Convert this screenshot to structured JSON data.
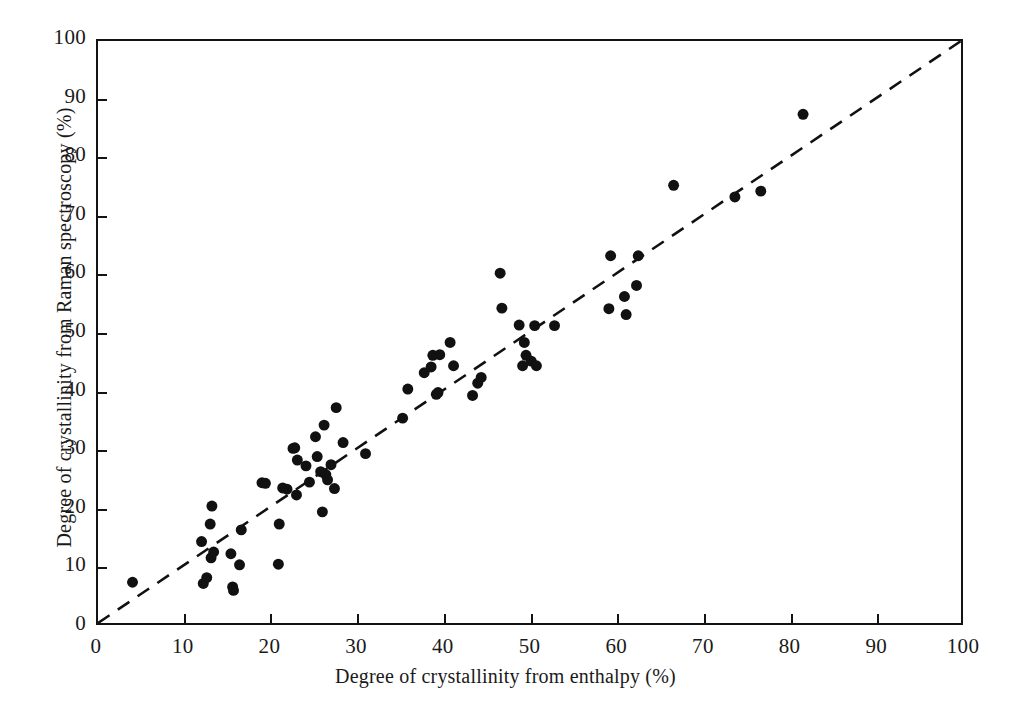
{
  "chart_data": {
    "type": "scatter",
    "title": "",
    "xlabel": "Degree of crystallinity from enthalpy (%)",
    "ylabel": "Degree of crystallinity from Raman spectroscopy (%)",
    "xlim": [
      0,
      100
    ],
    "ylim": [
      0,
      100
    ],
    "grid": false,
    "legend": null,
    "xticks": [
      0,
      10,
      20,
      30,
      40,
      50,
      60,
      70,
      80,
      90,
      100
    ],
    "yticks": [
      0,
      10,
      20,
      30,
      40,
      50,
      60,
      70,
      80,
      90,
      100
    ],
    "xtick_labels": [
      "0",
      "10",
      "20",
      "30",
      "40",
      "50",
      "60",
      "70",
      "80",
      "90",
      "100"
    ],
    "ytick_labels": [
      "0",
      "10",
      "20",
      "30",
      "40",
      "50",
      "60",
      "70",
      "80",
      "90",
      "100"
    ],
    "marker": {
      "shape": "circle",
      "color": "#111111",
      "size": 11
    },
    "reference_line": {
      "name": "one-to-one-line",
      "style": "dashed",
      "color": "#111111",
      "x": [
        0,
        100
      ],
      "y": [
        0,
        100
      ],
      "slope": 1,
      "intercept": 0
    },
    "series": [
      {
        "name": "samples",
        "points": [
          [
            4.0,
            7.0
          ],
          [
            12.0,
            14.0
          ],
          [
            12.2,
            6.8
          ],
          [
            12.6,
            7.8
          ],
          [
            13.0,
            17.0
          ],
          [
            13.1,
            11.2
          ],
          [
            13.2,
            20.1
          ],
          [
            13.4,
            12.2
          ],
          [
            15.4,
            11.9
          ],
          [
            15.6,
            6.2
          ],
          [
            15.7,
            5.6
          ],
          [
            16.4,
            10.0
          ],
          [
            16.6,
            16.0
          ],
          [
            19.0,
            24.1
          ],
          [
            19.4,
            24.0
          ],
          [
            20.9,
            10.1
          ],
          [
            21.0,
            17.0
          ],
          [
            21.4,
            23.2
          ],
          [
            21.9,
            23.0
          ],
          [
            22.6,
            30.0
          ],
          [
            22.8,
            30.1
          ],
          [
            23.0,
            22.0
          ],
          [
            23.1,
            28.0
          ],
          [
            24.1,
            27.0
          ],
          [
            24.5,
            24.2
          ],
          [
            25.2,
            32.0
          ],
          [
            25.4,
            28.6
          ],
          [
            25.8,
            26.0
          ],
          [
            26.0,
            19.1
          ],
          [
            26.2,
            34.0
          ],
          [
            26.4,
            25.5
          ],
          [
            26.6,
            24.6
          ],
          [
            27.0,
            27.2
          ],
          [
            27.4,
            23.1
          ],
          [
            27.6,
            37.0
          ],
          [
            28.4,
            31.0
          ],
          [
            31.0,
            29.1
          ],
          [
            35.3,
            35.2
          ],
          [
            35.9,
            40.2
          ],
          [
            37.8,
            43.0
          ],
          [
            38.6,
            44.0
          ],
          [
            38.8,
            46.0
          ],
          [
            39.2,
            39.3
          ],
          [
            39.4,
            39.6
          ],
          [
            39.6,
            46.1
          ],
          [
            40.8,
            48.2
          ],
          [
            41.2,
            44.2
          ],
          [
            43.4,
            39.1
          ],
          [
            44.0,
            41.2
          ],
          [
            44.4,
            42.2
          ],
          [
            46.6,
            60.1
          ],
          [
            46.8,
            54.1
          ],
          [
            48.8,
            51.2
          ],
          [
            49.2,
            44.2
          ],
          [
            49.4,
            48.2
          ],
          [
            49.6,
            46.0
          ],
          [
            50.2,
            45.0
          ],
          [
            50.6,
            51.1
          ],
          [
            50.8,
            44.2
          ],
          [
            52.9,
            51.1
          ],
          [
            59.2,
            54.0
          ],
          [
            59.4,
            63.1
          ],
          [
            61.0,
            56.1
          ],
          [
            61.2,
            53.0
          ],
          [
            62.4,
            58.0
          ],
          [
            62.6,
            63.1
          ],
          [
            66.7,
            75.2
          ],
          [
            73.8,
            73.2
          ],
          [
            76.8,
            74.2
          ],
          [
            81.7,
            87.4
          ]
        ]
      }
    ]
  },
  "axes": {
    "x_title": "Degree of crystallinity from enthalpy (%)",
    "y_title": "Degree of crystallinity from Raman spectroscopy (%)"
  }
}
